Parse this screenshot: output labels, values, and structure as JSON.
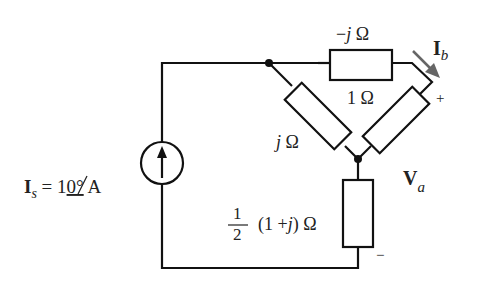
{
  "diagram": {
    "type": "ac-circuit",
    "source": {
      "symbol": "I",
      "subscript": "s",
      "equals": " = 1",
      "angle": "0°",
      "unit": " A",
      "kind": "current-source",
      "direction": "up"
    },
    "components": {
      "top": {
        "label_prefix": "−",
        "label_j": "j",
        "label_unit": " Ω",
        "value": "-j Ω"
      },
      "left_diag": {
        "label_j": "j",
        "label_unit": " Ω",
        "value": "j Ω"
      },
      "right_diag": {
        "label": "1 Ω",
        "value": "1 Ω"
      },
      "bottom": {
        "frac_num": "1",
        "frac_den": "2",
        "label_rest": "(1 +",
        "label_j": "j",
        "label_close": ") Ω",
        "value": "1/2 (1+j) Ω"
      }
    },
    "current_label": {
      "symbol": "I",
      "subscript": "b",
      "arrow_color": "#666666"
    },
    "voltage_label": {
      "symbol": "V",
      "subscript": "a",
      "plus": "+",
      "minus": "−"
    }
  }
}
